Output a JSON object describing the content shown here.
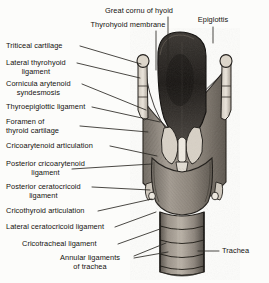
{
  "figure": {
    "caption_faint": "",
    "background_color": "#fcfcfa",
    "ink_color": "#14120f",
    "leader_color": "#2b2824"
  },
  "labels": [
    {
      "id": "great-cornu-of-hyoid",
      "text": "Great cornu of hyoid",
      "align": "center",
      "x": 139,
      "y": 7
    },
    {
      "id": "thyrohyoid-membrane",
      "text": "Thyrohyoid membrane",
      "align": "center",
      "x": 128,
      "y": 21
    },
    {
      "id": "epiglottis",
      "text": "Epiglottis",
      "align": "center",
      "x": 213,
      "y": 16
    },
    {
      "id": "triticeal-cartilage",
      "text": "Triticeal cartilage",
      "align": "left",
      "x": 6,
      "y": 42
    },
    {
      "id": "lateral-thyrohyoid-ligament",
      "text": "Lateral thyrohyoid",
      "text2": "ligament",
      "align": "left",
      "x": 6,
      "y": 59
    },
    {
      "id": "cornicula-arytenoid-syndesmosis",
      "text": "Cornicula arytenoid",
      "text2": "syndesmosis",
      "align": "left",
      "x": 6,
      "y": 80
    },
    {
      "id": "thyroepiglottic-ligament",
      "text": "Thyroepiglottic ligament",
      "align": "left",
      "x": 6,
      "y": 103
    },
    {
      "id": "foramen-of-thyroid-cartilage",
      "text": "Foramen of",
      "text2": "thyroid cartilage",
      "align": "left",
      "x": 6,
      "y": 118
    },
    {
      "id": "cricoarytenoid-articulation",
      "text": "Cricoarytenoid articulation",
      "align": "left",
      "x": 6,
      "y": 142
    },
    {
      "id": "posterior-cricoarytenoid-ligament",
      "text": "Posterior cricoarytenoid",
      "text2": "ligament",
      "align": "left",
      "x": 6,
      "y": 160
    },
    {
      "id": "posterior-ceratocricoid-ligament",
      "text": "Posterior ceratocricoid",
      "text2": "ligament",
      "align": "left",
      "x": 6,
      "y": 183
    },
    {
      "id": "cricothyroid-articulation",
      "text": "Cricothyroid articulation",
      "align": "left",
      "x": 6,
      "y": 207
    },
    {
      "id": "lateral-ceratocricoid-ligament",
      "text": "Lateral ceratocricoid ligament",
      "align": "left",
      "x": 6,
      "y": 223
    },
    {
      "id": "cricotracheal-ligament",
      "text": "Cricotracheal ligament",
      "align": "left",
      "x": 22,
      "y": 240
    },
    {
      "id": "annular-ligaments-of-trachea",
      "text": "Annular ligaments",
      "text2": "of trachea",
      "align": "left",
      "x": 60,
      "y": 254
    },
    {
      "id": "trachea",
      "text": "Trachea",
      "align": "left",
      "x": 222,
      "y": 247
    }
  ],
  "leader_lines": [
    {
      "id": "leader-great-cornu-of-hyoid",
      "d": "M168,17 L168,64"
    },
    {
      "id": "leader-thyrohyoid-membrane",
      "d": "M156,31 L156,70"
    },
    {
      "id": "leader-epiglottis",
      "d": "M213,27 L213,43"
    },
    {
      "id": "leader-triticeal-cartilage",
      "d": "M80,46 L141,64"
    },
    {
      "id": "leader-lateral-thyrohyoid-ligament",
      "d": "M77,63 L140,78"
    },
    {
      "id": "leader-cornicula-arytenoid-syndesmosis",
      "d": "M82,84 L146,110"
    },
    {
      "id": "leader-thyroepiglottic-ligament",
      "d": "M92,107 L160,122"
    },
    {
      "id": "leader-foramen-of-thyroid-cartilage",
      "d": "M80,126 L148,132"
    },
    {
      "id": "leader-cricoarytenoid-articulation",
      "d": "M110,146 L157,156"
    },
    {
      "id": "leader-posterior-cricoarytenoid-ligament",
      "d": "M72,169 L152,164"
    },
    {
      "id": "leader-posterior-ceratocricoid-ligament",
      "d": "M92,187 L150,190"
    },
    {
      "id": "leader-cricothyroid-articulation",
      "d": "M98,211 L152,199"
    },
    {
      "id": "leader-lateral-ceratocricoid-ligament",
      "d": "M115,227 L156,212"
    },
    {
      "id": "leader-cricotracheal-ligament",
      "d": "M118,244 L160,229"
    },
    {
      "id": "leader-annular-1",
      "d": "M134,256 L166,243"
    },
    {
      "id": "leader-annular-2",
      "d": "M134,258 L168,252"
    },
    {
      "id": "leader-trachea",
      "d": "M219,251 L198,251"
    }
  ],
  "anatomy_parts": [
    {
      "id": "epiglottis-body",
      "tone": "dark"
    },
    {
      "id": "left-superior-cornu",
      "tone": "light"
    },
    {
      "id": "right-superior-cornu",
      "tone": "light"
    },
    {
      "id": "left-triticeal-nodule",
      "tone": "light"
    },
    {
      "id": "right-triticeal-nodule",
      "tone": "light"
    },
    {
      "id": "thyroid-lamina-left",
      "tone": "mid"
    },
    {
      "id": "thyroid-lamina-right",
      "tone": "mid"
    },
    {
      "id": "arytenoid-cartilages",
      "tone": "light"
    },
    {
      "id": "cricoid-cartilage",
      "tone": "mid"
    },
    {
      "id": "left-inferior-cornu",
      "tone": "light"
    },
    {
      "id": "right-inferior-cornu",
      "tone": "light"
    },
    {
      "id": "trachea-tube",
      "tone": "mid"
    },
    {
      "id": "tracheal-ring-1",
      "tone": "light"
    },
    {
      "id": "tracheal-ring-2",
      "tone": "light"
    },
    {
      "id": "tracheal-ring-3",
      "tone": "light"
    },
    {
      "id": "tracheal-ring-4",
      "tone": "light"
    }
  ]
}
